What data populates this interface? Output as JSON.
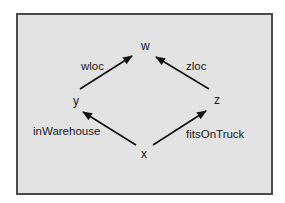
{
  "diagram": {
    "type": "commutative-square",
    "colors": {
      "background": "#e3e3e3",
      "border": "#4a4a4a",
      "ink": "#111111"
    },
    "nodes": [
      {
        "id": "w",
        "label": "w",
        "x": 145,
        "y": 50
      },
      {
        "id": "y",
        "label": "y",
        "x": 77,
        "y": 105
      },
      {
        "id": "z",
        "label": "z",
        "x": 218,
        "y": 104
      },
      {
        "id": "x",
        "label": "x",
        "x": 145,
        "y": 158
      }
    ],
    "edges": [
      {
        "from": "y",
        "to": "w",
        "label": "wloc"
      },
      {
        "from": "z",
        "to": "w",
        "label": "zloc"
      },
      {
        "from": "x",
        "to": "y",
        "label": "inWarehouse"
      },
      {
        "from": "x",
        "to": "z",
        "label": "fitsOnTruck"
      }
    ]
  }
}
